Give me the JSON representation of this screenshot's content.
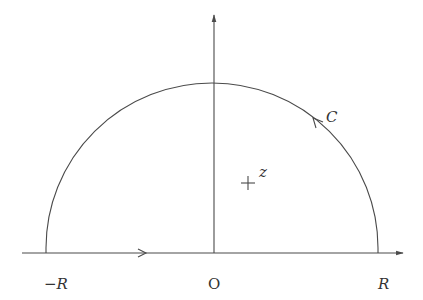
{
  "diagram": {
    "labels": {
      "neg_R": "−R",
      "origin": "O",
      "pos_R": "R",
      "contour": "C",
      "point": "z"
    },
    "colors": {
      "stroke": "#4a4a4a",
      "text": "#333333",
      "background": "#ffffff"
    }
  }
}
